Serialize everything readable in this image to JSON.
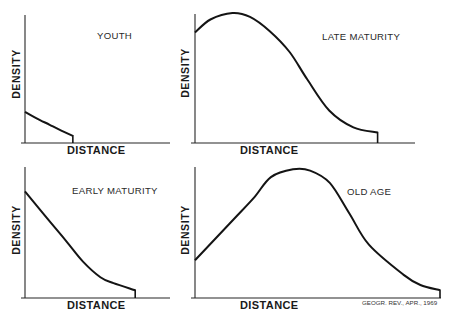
{
  "figure": {
    "credit": "GEOGR. REV., APR., 1969",
    "ink_color": "#141414",
    "background_color": "#ffffff"
  },
  "chart_data": [
    {
      "type": "line",
      "title": "YOUTH",
      "xlabel": "DISTANCE",
      "ylabel": "DENSITY",
      "grid": false,
      "tick_labels": false,
      "xlim": [
        0,
        1
      ],
      "ylim": [
        0,
        1
      ],
      "x": [
        0,
        0.08,
        0.17,
        0.25,
        0.33
      ],
      "y": [
        0.24,
        0.19,
        0.14,
        0.095,
        0.055
      ],
      "drops_to_zero_at_end": true
    },
    {
      "type": "line",
      "title": "LATE MATURITY",
      "xlabel": "DISTANCE",
      "ylabel": "DENSITY",
      "grid": false,
      "tick_labels": false,
      "xlim": [
        0,
        1
      ],
      "ylim": [
        0,
        1
      ],
      "x": [
        0,
        0.07,
        0.17,
        0.25,
        0.34,
        0.43,
        0.51,
        0.61,
        0.72,
        0.83
      ],
      "y": [
        0.85,
        0.95,
        1.0,
        0.97,
        0.86,
        0.7,
        0.49,
        0.25,
        0.12,
        0.08
      ],
      "drops_to_zero_at_end": true
    },
    {
      "type": "line",
      "title": "EARLY MATURITY",
      "xlabel": "DISTANCE",
      "ylabel": "DENSITY",
      "grid": false,
      "tick_labels": false,
      "xlim": [
        0,
        1
      ],
      "ylim": [
        0,
        1
      ],
      "x": [
        0,
        0.17,
        0.29,
        0.4,
        0.52,
        0.61,
        0.76
      ],
      "y": [
        0.82,
        0.59,
        0.43,
        0.28,
        0.16,
        0.115,
        0.06
      ],
      "drops_to_zero_at_end": true
    },
    {
      "type": "line",
      "title": "OLD AGE",
      "xlabel": "DISTANCE",
      "ylabel": "DENSITY",
      "grid": false,
      "tick_labels": false,
      "xlim": [
        0,
        1
      ],
      "ylim": [
        0,
        1
      ],
      "x": [
        0,
        0.155,
        0.24,
        0.31,
        0.4,
        0.47,
        0.55,
        0.63,
        0.71,
        0.85,
        0.92,
        1.0
      ],
      "y": [
        0.29,
        0.6,
        0.77,
        0.93,
        0.99,
        0.98,
        0.885,
        0.65,
        0.41,
        0.18,
        0.1,
        0.06
      ],
      "drops_to_zero_at_end": true
    }
  ]
}
